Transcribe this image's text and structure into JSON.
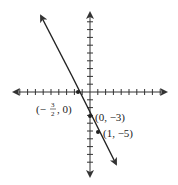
{
  "chart_data": {
    "type": "line",
    "title": "",
    "xlabel": "",
    "ylabel": "",
    "xlim": [
      -10,
      10
    ],
    "ylim": [
      -10,
      10
    ],
    "grid": false,
    "axes_arrows": true,
    "series": [
      {
        "name": "y = -2x - 3",
        "slope": -2,
        "intercept": -3,
        "x": [
          -6.1,
          3.2
        ],
        "y": [
          9.5,
          -9.2
        ]
      }
    ],
    "points": [
      {
        "x": -1.5,
        "y": 0,
        "label": "(-3/2, 0)"
      },
      {
        "x": 0,
        "y": -3,
        "label": "(0, -3)"
      },
      {
        "x": 1,
        "y": -5,
        "label": "(1, -5)"
      }
    ]
  },
  "labels": {
    "p1_open": "(−",
    "p1_num": "3",
    "p1_den": "2",
    "p1_close": ", 0)",
    "p2": "(0, −3)",
    "p3": "(1, −5)"
  },
  "colors": {
    "axis": "#333333",
    "line": "#222222"
  }
}
